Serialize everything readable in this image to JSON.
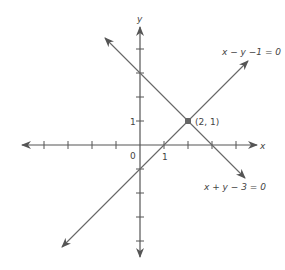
{
  "diagram": {
    "type": "coordinate-plane",
    "axes": {
      "x_label": "x",
      "y_label": "y",
      "origin_label": "0",
      "x_tick_label": "1",
      "y_tick_label": "1",
      "unit_px": 24,
      "origin_px": [
        140,
        145
      ]
    },
    "lines": [
      {
        "equation": "x − y − 1 = 0",
        "label": "x − y −1 = 0"
      },
      {
        "equation": "x + y − 3 = 0",
        "label": "x + y − 3 = 0"
      }
    ],
    "intersection": {
      "label": "(2, 1)",
      "x": 2,
      "y": 1
    },
    "colors": {
      "ink": "#555555",
      "point": "#666666"
    }
  }
}
